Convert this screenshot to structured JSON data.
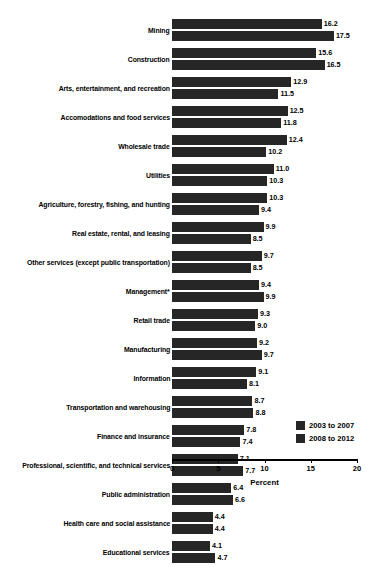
{
  "chart_data": {
    "type": "bar",
    "orientation": "horizontal",
    "title": "",
    "xlabel": "Percent",
    "ylabel": "",
    "xlim": [
      0,
      20
    ],
    "xticks": [
      0,
      5,
      10,
      15,
      20
    ],
    "grid": false,
    "legend_position": "bottom-right",
    "categories": [
      "Mining",
      "Construction",
      "Arts, entertainment, and recreation",
      "Accomodations and food services",
      "Wholesale trade",
      "Utilities",
      "Agriculture, forestry, fishing, and hunting",
      "Real estate, rental, and leasing",
      "Other services (except public transportation)",
      "Management*",
      "Retail trade",
      "Manufacturing",
      "Information",
      "Transportation and warehousing",
      "Finance and insurance",
      "Professional, scientific, and technical services",
      "Public administration",
      "Health care and social assistance",
      "Educational services"
    ],
    "series": [
      {
        "name": "2003 to 2007",
        "color": "#262626",
        "values": [
          16.2,
          15.6,
          12.9,
          12.5,
          12.4,
          11.0,
          10.3,
          9.9,
          9.7,
          9.4,
          9.3,
          9.2,
          9.1,
          8.7,
          7.8,
          7.1,
          6.4,
          4.4,
          4.1
        ],
        "labels": [
          "16.2",
          "15.6",
          "12.9",
          "12.5",
          "12.4",
          "11.0",
          "10.3",
          "9.9",
          "9.7",
          "9.4",
          "9.3",
          "9.2",
          "9.1",
          "8.7",
          "7.8",
          "7.1",
          "6.4",
          "4.4",
          "4.1"
        ]
      },
      {
        "name": "2008 to 2012",
        "color": "#262626",
        "values": [
          17.5,
          16.5,
          11.5,
          11.8,
          10.2,
          10.3,
          9.4,
          8.5,
          8.5,
          9.9,
          9.0,
          9.7,
          8.1,
          8.8,
          7.4,
          7.7,
          6.6,
          4.4,
          4.7
        ],
        "labels": [
          "17.5",
          "16.5",
          "11.5",
          "11.8",
          "10.2",
          "10.3",
          "9.4",
          "8.5",
          "8.5",
          "9.9",
          "9.0",
          "9.7",
          "8.1",
          "8.8",
          "7.4",
          "7.7",
          "6.6",
          "4.4",
          "4.7"
        ]
      }
    ]
  },
  "axis": {
    "tick_labels": [
      "0",
      "5",
      "10",
      "15",
      "20"
    ],
    "title": "Percent"
  },
  "legend": {
    "items": [
      {
        "label": "2003 to 2007"
      },
      {
        "label": "2008 to 2012"
      }
    ]
  }
}
